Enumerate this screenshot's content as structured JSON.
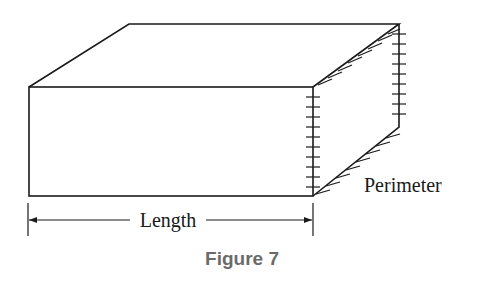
{
  "diagram": {
    "labels": {
      "length": "Length",
      "perimeter": "Perimeter"
    },
    "caption": "Figure 7",
    "colors": {
      "line": "#1a1a1a",
      "caption": "#6b6b6b"
    }
  }
}
